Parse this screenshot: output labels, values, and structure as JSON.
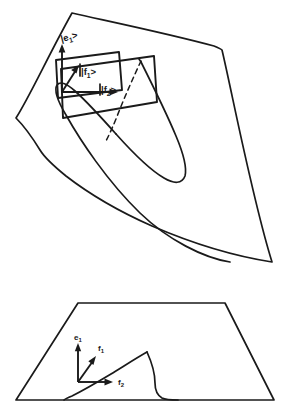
{
  "figure": {
    "type": "diagram",
    "background_color": "#ffffff",
    "stroke_color": "#1a1a1a",
    "panels": [
      {
        "id": "upper-panel",
        "name": "folded-surface-panel",
        "description": "Folded (cusp / Whitney pleat) surface shown in perspective with an inset tangent plane parallelogram and three basis vectors drawn from a common origin.",
        "labels": [
          {
            "id": "e1-ket",
            "text": "|e",
            "subscript": "1",
            "bracket": ">",
            "full": "|e1>",
            "x": 63,
            "y": 40
          },
          {
            "id": "f1-ket",
            "text": "|f",
            "subscript": "1",
            "bracket": ">",
            "full": "|f1>",
            "x": 80,
            "y": 75
          },
          {
            "id": "f2-ket",
            "text": "|f",
            "subscript": "2",
            "bracket": ">",
            "full": "|f2>",
            "x": 99,
            "y": 94
          }
        ],
        "vectors": [
          {
            "id": "e1-arrow",
            "name": "basis-vector-e1",
            "label": "|e1>",
            "direction": "up"
          },
          {
            "id": "f1-arrow",
            "name": "basis-vector-f1",
            "label": "|f1>",
            "direction": "up-right-diagonal"
          },
          {
            "id": "f2-arrow",
            "name": "basis-vector-f2",
            "label": "|f2>",
            "direction": "right"
          }
        ],
        "elements": [
          "surface-outline",
          "fold-curve",
          "cusp-apex",
          "tangent-plane-parallelogram",
          "hidden-dashed-edge"
        ]
      },
      {
        "id": "lower-panel",
        "name": "projection-panel",
        "description": "Planar trapezoidal base showing the projected cusp (fold) curve and the same three basis vectors without ket brackets.",
        "labels": [
          {
            "id": "e1-plain",
            "text": "e",
            "subscript": "1",
            "full": "e1",
            "x": 67,
            "y": 338
          },
          {
            "id": "f1-plain",
            "text": "f",
            "subscript": "1",
            "full": "f1",
            "x": 87,
            "y": 347
          },
          {
            "id": "f2-plain",
            "text": "f",
            "subscript": "2",
            "full": "f2",
            "x": 117,
            "y": 385
          }
        ],
        "vectors": [
          {
            "id": "e1-arrow-proj",
            "name": "basis-vector-e1",
            "label": "e1",
            "direction": "up"
          },
          {
            "id": "f1-arrow-proj",
            "name": "basis-vector-f1",
            "label": "f1",
            "direction": "up-right-diagonal"
          },
          {
            "id": "f2-arrow-proj",
            "name": "basis-vector-f2",
            "label": "f2",
            "direction": "right"
          }
        ],
        "elements": [
          "trapezoid-base-outline",
          "projected-cusp-curve"
        ]
      }
    ]
  }
}
